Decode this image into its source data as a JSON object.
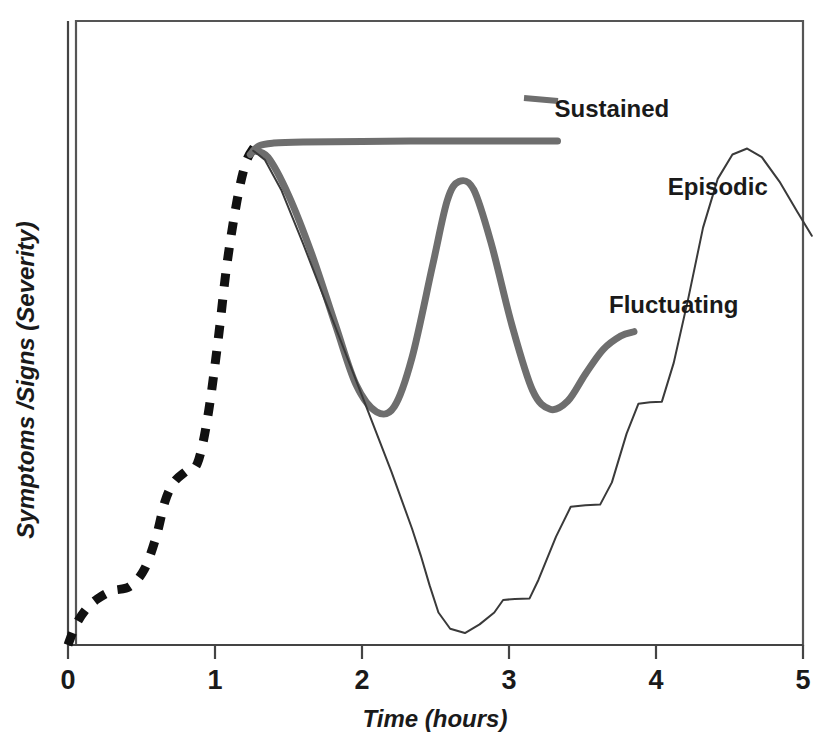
{
  "figure": {
    "background_color": "#ffffff",
    "frame_color": "#555555",
    "axis_color": "#444444"
  },
  "chart_data": {
    "type": "line",
    "title": "",
    "xlabel": "Time (hours)",
    "ylabel": "Symptoms /Signs (Severity)",
    "xlim": [
      0,
      5
    ],
    "ylim": [
      0,
      1
    ],
    "xticks": [
      0,
      1,
      2,
      3,
      4,
      5
    ],
    "xtick_labels": [
      "0",
      "1",
      "2",
      "3",
      "4",
      "5"
    ],
    "yticks": [],
    "ytick_labels": [],
    "grid": false,
    "legend": "inline-annotations",
    "series": [
      {
        "name": "Onset",
        "label": "",
        "style": "dashed",
        "color": "#111111",
        "width": 9,
        "points": [
          [
            0.0,
            0.0
          ],
          [
            0.05,
            0.035
          ],
          [
            0.12,
            0.065
          ],
          [
            0.2,
            0.085
          ],
          [
            0.3,
            0.1
          ],
          [
            0.42,
            0.108
          ],
          [
            0.52,
            0.14
          ],
          [
            0.6,
            0.2
          ],
          [
            0.66,
            0.265
          ],
          [
            0.72,
            0.3
          ],
          [
            0.8,
            0.32
          ],
          [
            0.88,
            0.335
          ],
          [
            0.95,
            0.42
          ],
          [
            1.02,
            0.56
          ],
          [
            1.08,
            0.7
          ],
          [
            1.15,
            0.82
          ],
          [
            1.21,
            0.89
          ],
          [
            1.27,
            0.92
          ]
        ]
      },
      {
        "name": "Sustained",
        "label": "Sustained",
        "style": "solid-thick",
        "color": "#6e6e6e",
        "width": 7,
        "points": [
          [
            1.24,
            0.905
          ],
          [
            1.3,
            0.921
          ],
          [
            1.4,
            0.926
          ],
          [
            1.6,
            0.928
          ],
          [
            2.0,
            0.929
          ],
          [
            2.5,
            0.93
          ],
          [
            3.0,
            0.93
          ],
          [
            3.33,
            0.93
          ]
        ],
        "label_pos": [
          3.7,
          0.975
        ]
      },
      {
        "name": "Fluctuating",
        "label": "Fluctuating",
        "style": "solid-thick",
        "color": "#6e6e6e",
        "width": 7,
        "points": [
          [
            1.26,
            0.912
          ],
          [
            1.36,
            0.9
          ],
          [
            1.5,
            0.83
          ],
          [
            1.66,
            0.72
          ],
          [
            1.82,
            0.59
          ],
          [
            1.96,
            0.48
          ],
          [
            2.1,
            0.43
          ],
          [
            2.22,
            0.44
          ],
          [
            2.34,
            0.53
          ],
          [
            2.48,
            0.7
          ],
          [
            2.58,
            0.82
          ],
          [
            2.66,
            0.855
          ],
          [
            2.76,
            0.84
          ],
          [
            2.88,
            0.74
          ],
          [
            3.02,
            0.59
          ],
          [
            3.16,
            0.47
          ],
          [
            3.28,
            0.435
          ],
          [
            3.4,
            0.45
          ],
          [
            3.52,
            0.5
          ],
          [
            3.64,
            0.545
          ],
          [
            3.76,
            0.57
          ],
          [
            3.85,
            0.578
          ]
        ],
        "label_pos": [
          4.12,
          0.612
        ]
      },
      {
        "name": "Episodic",
        "label": "Episodic",
        "style": "solid-thin",
        "color": "#3a3a3a",
        "width": 2,
        "points": [
          [
            1.26,
            0.912
          ],
          [
            1.34,
            0.895
          ],
          [
            1.45,
            0.84
          ],
          [
            1.6,
            0.74
          ],
          [
            1.8,
            0.6
          ],
          [
            2.0,
            0.46
          ],
          [
            2.2,
            0.32
          ],
          [
            2.34,
            0.215
          ],
          [
            2.4,
            0.165
          ],
          [
            2.46,
            0.11
          ],
          [
            2.52,
            0.06
          ],
          [
            2.6,
            0.03
          ],
          [
            2.7,
            0.022
          ],
          [
            2.8,
            0.038
          ],
          [
            2.9,
            0.06
          ],
          [
            2.96,
            0.083
          ],
          [
            3.04,
            0.085
          ],
          [
            3.14,
            0.086
          ],
          [
            3.2,
            0.12
          ],
          [
            3.32,
            0.2
          ],
          [
            3.42,
            0.255
          ],
          [
            3.52,
            0.258
          ],
          [
            3.62,
            0.259
          ],
          [
            3.7,
            0.3
          ],
          [
            3.8,
            0.39
          ],
          [
            3.88,
            0.445
          ],
          [
            3.96,
            0.448
          ],
          [
            4.04,
            0.449
          ],
          [
            4.12,
            0.52
          ],
          [
            4.22,
            0.64
          ],
          [
            4.32,
            0.77
          ],
          [
            4.42,
            0.86
          ],
          [
            4.52,
            0.905
          ],
          [
            4.62,
            0.916
          ],
          [
            4.72,
            0.9
          ],
          [
            4.84,
            0.855
          ],
          [
            4.96,
            0.8
          ],
          [
            5.06,
            0.755
          ]
        ],
        "label_pos": [
          4.42,
          0.83
        ]
      }
    ],
    "annotations": [
      {
        "text": "Sustained",
        "x": 3.7,
        "y": 0.975
      },
      {
        "text": "Episodic",
        "x": 4.42,
        "y": 0.83
      },
      {
        "text": "Fluctuating",
        "x": 4.12,
        "y": 0.612
      }
    ]
  },
  "caption": {
    "ghost_text": ""
  }
}
